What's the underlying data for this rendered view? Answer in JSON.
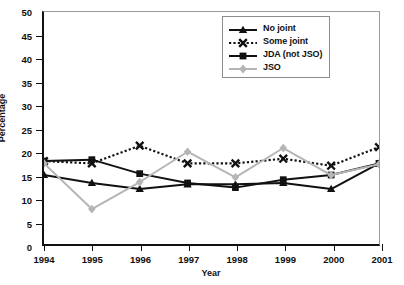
{
  "chart_data": {
    "type": "line",
    "title": "",
    "xlabel": "Year",
    "ylabel": "Percentage",
    "x": [
      1994,
      1995,
      1996,
      1997,
      1998,
      1999,
      2000,
      2001
    ],
    "categories": [
      "1994",
      "1995",
      "1996",
      "1997",
      "1998",
      "1999",
      "2000",
      "2001"
    ],
    "xlim": [
      1994,
      2001
    ],
    "ylim": [
      0,
      50
    ],
    "yticks": [
      0,
      5,
      10,
      15,
      20,
      25,
      30,
      35,
      40,
      45,
      50
    ],
    "grid": false,
    "legend_position": "top-right",
    "series": [
      {
        "name": "No joint",
        "values": [
          15.0,
          13.3,
          12.0,
          13.0,
          13.0,
          13.3,
          12.0,
          17.5
        ],
        "color": "#111111",
        "marker": "triangle",
        "linestyle": "solid"
      },
      {
        "name": "Some joint",
        "values": [
          18.0,
          17.5,
          21.3,
          17.5,
          17.5,
          18.5,
          17.0,
          21.0
        ],
        "color": "#111111",
        "marker": "x",
        "linestyle": "dotted"
      },
      {
        "name": "JDA (not JSO)",
        "values": [
          18.0,
          18.3,
          15.3,
          13.3,
          12.3,
          14.0,
          15.0,
          17.5
        ],
        "color": "#111111",
        "marker": "square",
        "linestyle": "solid"
      },
      {
        "name": "JSO",
        "values": [
          17.5,
          7.7,
          13.5,
          20.0,
          14.5,
          20.8,
          15.0,
          17.3
        ],
        "color": "#b5b5b5",
        "marker": "diamond",
        "linestyle": "solid"
      }
    ]
  }
}
